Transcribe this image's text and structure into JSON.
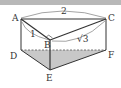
{
  "diagram": {
    "type": "triangular prism",
    "vertices": {
      "A": "A",
      "B": "B",
      "C": "C",
      "D": "D",
      "E": "E",
      "F": "F"
    },
    "measures": {
      "AC": "2",
      "AB": "1",
      "BC": "√3"
    },
    "shaded_face": "DEF",
    "right_angle_at": "B",
    "colors": {
      "line": "#333333",
      "shade": "#c8c8c8",
      "band": "#b8b8b8"
    }
  }
}
